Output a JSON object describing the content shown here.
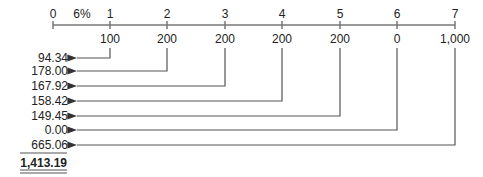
{
  "diagram": {
    "type": "cash-flow-timeline",
    "rate_label": "6%",
    "periods": [
      "0",
      "1",
      "2",
      "3",
      "4",
      "5",
      "6",
      "7"
    ],
    "cash_flows": [
      "",
      "100",
      "200",
      "200",
      "200",
      "200",
      "0",
      "1,000"
    ],
    "present_values": [
      "94.34",
      "178.00",
      "167.92",
      "158.42",
      "149.45",
      "0.00",
      "665.06"
    ],
    "total": "1,413.19"
  },
  "colors": {
    "line": "#555555",
    "text": "#222222"
  }
}
